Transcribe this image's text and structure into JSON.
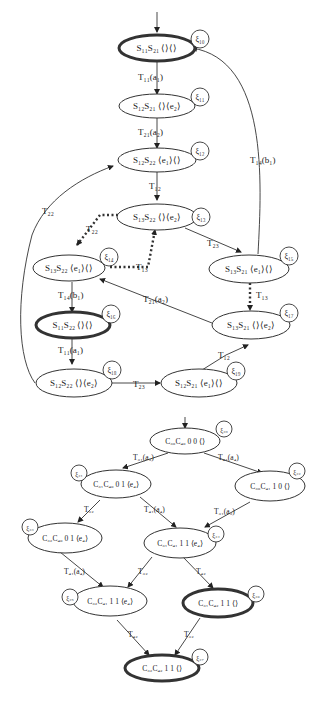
{
  "top_diagram": {
    "nodes": [
      {
        "id": "xi10",
        "label": "S₁₁S₂₁   ⟨⟩⟨⟩",
        "xi": "ξ₁₀",
        "final": true
      },
      {
        "id": "xi11",
        "label": "S₁₂S₂₁   ⟨⟩⟨e₂⟩",
        "xi": "ξ₁₁",
        "final": false
      },
      {
        "id": "xi12",
        "label": "S₁₂S₂₂   ⟨e₁⟩⟨⟩",
        "xi": "ξ₁₂",
        "final": false
      },
      {
        "id": "xi13",
        "label": "S₁₃S₂₂   ⟨⟩⟨e₂⟩",
        "xi": "ξ₁₃",
        "final": false
      },
      {
        "id": "xi14",
        "label": "S₁₃S₂₂   ⟨e₁⟩⟨⟩",
        "xi": "ξ₁₄",
        "final": false
      },
      {
        "id": "xi15",
        "label": "S₁₃S₂₁   ⟨e₁⟩⟨⟩",
        "xi": "ξ₁₅",
        "final": false
      },
      {
        "id": "xi16",
        "label": "S₁₁S₂₂   ⟨⟩⟨⟩",
        "xi": "ξ₁₆",
        "final": true
      },
      {
        "id": "xi17",
        "label": "S₁₃S₂₁   ⟨⟩⟨e₂⟩",
        "xi": "ξ₁₇",
        "final": false
      },
      {
        "id": "xi18",
        "label": "S₁₂S₂₂   ⟨⟩⟨e₂⟩",
        "xi": "ξ₁₈",
        "final": false
      },
      {
        "id": "xi19",
        "label": "S₁₂S₂₁   ⟨e₁⟩⟨⟩",
        "xi": "ξ₁₉",
        "final": false
      }
    ],
    "edges": [
      {
        "from": "xi10",
        "to": "xi11",
        "label": "T₁₁(a₁)"
      },
      {
        "from": "xi11",
        "to": "xi12",
        "label": "T₂₁(a₂)"
      },
      {
        "from": "xi12",
        "to": "xi13",
        "label": "T₁₂"
      },
      {
        "from": "xi13",
        "to": "xi14",
        "label": "T₂₂",
        "style": "dotted"
      },
      {
        "from": "xi14",
        "to": "xi13",
        "label": "T₁₃",
        "style": "dotted"
      },
      {
        "from": "xi13",
        "to": "xi15",
        "label": "T₂₃"
      },
      {
        "from": "xi15",
        "to": "xi10",
        "label": "T₁₄(b₁)"
      },
      {
        "from": "xi15",
        "to": "xi17",
        "label": "T₁₃",
        "style": "dotted"
      },
      {
        "from": "xi17",
        "to": "xi14",
        "label": "T₂₁(a₂)"
      },
      {
        "from": "xi14",
        "to": "xi16",
        "label": "T₁₄(b₁)"
      },
      {
        "from": "xi16",
        "to": "xi18",
        "label": "T₁₁(a₁)"
      },
      {
        "from": "xi18",
        "to": "xi19",
        "label": "T₂₃"
      },
      {
        "from": "xi19",
        "to": "xi17",
        "label": "T₁₂"
      },
      {
        "from": "xi18",
        "to": "xi12",
        "label": "T₂₂"
      }
    ]
  },
  "bottom_diagram": {
    "nodes": [
      {
        "id": "xi20",
        "label": "C₃₀C₄₀  0 0  ⟨⟩",
        "xi": "ξ₂₀",
        "final": false
      },
      {
        "id": "xi21",
        "label": "C₃₁C₄₀   0 1   ⟨e₄⟩",
        "xi": "ξ₂₁",
        "final": false
      },
      {
        "id": "xi22",
        "label": "C₃₀C₄₁  1 0    ⟨⟩",
        "xi": "ξ₂₂",
        "final": false
      },
      {
        "id": "xi23",
        "label": "C₃₂C₄₀   0 1   ⟨e₄⟩",
        "xi": "ξ₂₃",
        "final": false
      },
      {
        "id": "xi24",
        "label": "C₃₁C₄₁   1 1   ⟨e₄⟩",
        "xi": "ξ₂₄",
        "final": false
      },
      {
        "id": "xi25",
        "label": "C₃₂C₄₁    1 1   ⟨e₄⟩",
        "xi": "ξ₂₅",
        "final": false
      },
      {
        "id": "xi26",
        "label": "C₃₁C₄₂    1 1   ⟨⟩",
        "xi": "ξ₂₆",
        "final": true
      },
      {
        "id": "xi27",
        "label": "C₃₂C₄₂    1 1   ⟨⟩",
        "xi": "ξ₂₇",
        "final": true
      }
    ],
    "edges": [
      {
        "from": "xi20",
        "to": "xi21",
        "label": "T₃₁(a₃)"
      },
      {
        "from": "xi20",
        "to": "xi22",
        "label": "T₄₁(a₄)"
      },
      {
        "from": "xi21",
        "to": "xi23",
        "label": "T₃₂"
      },
      {
        "from": "xi21",
        "to": "xi24",
        "label": "T₄₁(a₄)"
      },
      {
        "from": "xi22",
        "to": "xi24",
        "label": "T₃₁(a₃)"
      },
      {
        "from": "xi23",
        "to": "xi25",
        "label": "T₄₁(a₄)"
      },
      {
        "from": "xi24",
        "to": "xi25",
        "label": "T₃₂"
      },
      {
        "from": "xi24",
        "to": "xi26",
        "label": "T₄₂"
      },
      {
        "from": "xi25",
        "to": "xi27",
        "label": "T₄₂"
      },
      {
        "from": "xi26",
        "to": "xi27",
        "label": "T₃₂"
      }
    ]
  }
}
